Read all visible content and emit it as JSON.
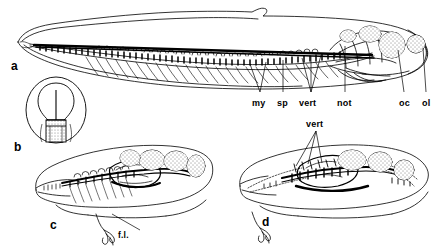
{
  "figure": {
    "type": "anatomical-line-drawing",
    "background_color": "#ffffff",
    "ink_color": "#000000",
    "panels": [
      {
        "id": "a",
        "label": "a",
        "description": "lateral view of whole larva with fin fold, showing axial skeleton, notochord and head cartilages",
        "label_pos": {
          "x": 11,
          "y": 59
        }
      },
      {
        "id": "b",
        "label": "b",
        "description": "transverse cross-section through trunk showing neural tube and notochord",
        "label_pos": {
          "x": 14,
          "y": 140
        }
      },
      {
        "id": "c",
        "label": "c",
        "description": "later larval stage, lateral view, with forelimb bud",
        "label_pos": {
          "x": 50,
          "y": 218
        }
      },
      {
        "id": "d",
        "label": "d",
        "description": "metamorphosing stage, lateral view, with ossified vertebrae",
        "label_pos": {
          "x": 262,
          "y": 215
        }
      }
    ],
    "annotations": [
      {
        "text": "my",
        "x": 252,
        "y": 98,
        "panel": "a",
        "meaning": "myotome",
        "leaders": 2
      },
      {
        "text": "sp",
        "x": 277,
        "y": 98,
        "panel": "a",
        "meaning": "spinal cord",
        "leaders": 1
      },
      {
        "text": "vert",
        "x": 299,
        "y": 98,
        "panel": "a",
        "meaning": "vertebra",
        "leaders": 3
      },
      {
        "text": "not",
        "x": 337,
        "y": 98,
        "panel": "a",
        "meaning": "notochord",
        "leaders": 1
      },
      {
        "text": "oc",
        "x": 399,
        "y": 98,
        "panel": "a",
        "meaning": "otic capsule",
        "leaders": 1
      },
      {
        "text": "ol",
        "x": 422,
        "y": 98,
        "panel": "a",
        "meaning": "olfactory",
        "leaders": 1
      },
      {
        "text": "f.l.",
        "x": 118,
        "y": 230,
        "panel": "c",
        "meaning": "forelimb",
        "leaders": 1
      },
      {
        "text": "vert",
        "x": 306,
        "y": 119,
        "panel": "d",
        "meaning": "vertebra",
        "leaders": 3
      }
    ]
  }
}
